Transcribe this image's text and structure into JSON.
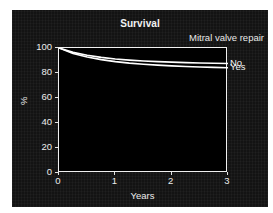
{
  "figure": {
    "title": "Survival",
    "legend_title": "Mitral valve repair",
    "background": "#131313",
    "plot_background": "#000000",
    "axis_color": "#f0f0f0",
    "curve_color": "#ffffff"
  },
  "chart_data": {
    "type": "line",
    "title": "Survival",
    "xlabel": "Years",
    "ylabel": "%",
    "xlim": [
      0,
      3
    ],
    "ylim": [
      0,
      100
    ],
    "xticks": [
      0,
      1,
      2,
      3
    ],
    "xtick_labels": [
      "0",
      "1",
      "2",
      "3"
    ],
    "yticks": [
      0,
      20,
      40,
      60,
      80,
      100
    ],
    "ytick_labels": [
      "0",
      "20",
      "40",
      "60",
      "80",
      "100"
    ],
    "grid": false,
    "legend_title": "Mitral valve repair",
    "legend_position": "right-of-curve-ends",
    "series": [
      {
        "name": "No",
        "label": "No",
        "color": "#ffffff",
        "x": [
          0,
          0.25,
          0.5,
          0.75,
          1.0,
          1.25,
          1.5,
          1.75,
          2.0,
          2.25,
          2.5,
          2.75,
          3.0
        ],
        "values": [
          100,
          96.5,
          94.2,
          92.5,
          91.2,
          90.3,
          89.6,
          89.1,
          88.7,
          88.3,
          88.0,
          87.8,
          87.6
        ]
      },
      {
        "name": "Yes",
        "label": "Yes",
        "color": "#ffffff",
        "x": [
          0,
          0.25,
          0.5,
          0.75,
          1.0,
          1.25,
          1.5,
          1.75,
          2.0,
          2.25,
          2.5,
          2.75,
          3.0
        ],
        "values": [
          100,
          95.6,
          92.8,
          90.7,
          89.1,
          87.9,
          87.0,
          86.3,
          85.7,
          85.2,
          84.8,
          84.5,
          84.2
        ]
      }
    ]
  }
}
